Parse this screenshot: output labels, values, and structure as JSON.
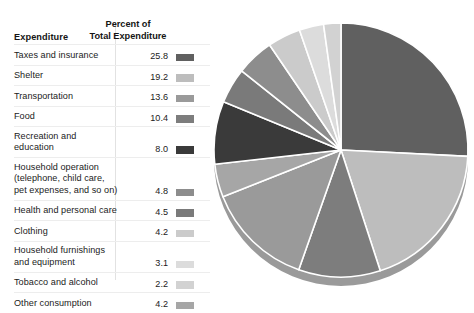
{
  "table": {
    "header_label": "Expenditure",
    "header_percent_line1": "Percent of",
    "header_percent_line2": "Total Expenditure"
  },
  "rows": [
    {
      "label": "Taxes and insurance",
      "label2": "",
      "label3": "",
      "value": "25.8",
      "color": "#606060"
    },
    {
      "label": "Shelter",
      "label2": "",
      "label3": "",
      "value": "19.2",
      "color": "#bdbdbd"
    },
    {
      "label": "Transportation",
      "label2": "",
      "label3": "",
      "value": "13.6",
      "color": "#9a9a9a"
    },
    {
      "label": "Food",
      "label2": "",
      "label3": "",
      "value": "10.4",
      "color": "#7d7d7d"
    },
    {
      "label": "Recreation and education",
      "label2": "",
      "label3": "",
      "value": "8.0",
      "color": "#3a3a3a"
    },
    {
      "label": "Household operation",
      "label2": "(telephone, child care,",
      "label3": "pet expenses, and so on)",
      "value": "4.8",
      "color": "#8d8d8d"
    },
    {
      "label": "Health and personal care",
      "label2": "",
      "label3": "",
      "value": "4.5",
      "color": "#7a7a7a"
    },
    {
      "label": "Clothing",
      "label2": "",
      "label3": "",
      "value": "4.2",
      "color": "#cbcbcb"
    },
    {
      "label": "Household furnishings",
      "label2": "and equipment",
      "label3": "",
      "value": "3.1",
      "color": "#dcdcdc"
    },
    {
      "label": "Tobacco and alcohol",
      "label2": "",
      "label3": "",
      "value": "2.2",
      "color": "#d2d2d2"
    },
    {
      "label": "Other consumption",
      "label2": "",
      "label3": "",
      "value": "4.2",
      "color": "#a6a6a6"
    }
  ],
  "chart_data": {
    "type": "pie",
    "title": "",
    "unit": "percent",
    "start_angle_deg": 0,
    "direction": "clockwise",
    "separator_color": "#ffffff",
    "rim_color": "#9a9a9a",
    "categories": [
      "Taxes and insurance",
      "Shelter",
      "Food",
      "Transportation",
      "Other consumption",
      "Recreation and education",
      "Health and personal care",
      "Household operation",
      "Clothing",
      "Household furnishings and equipment",
      "Tobacco and alcohol"
    ],
    "values": [
      25.8,
      19.2,
      10.4,
      13.6,
      4.2,
      8.0,
      4.5,
      4.8,
      4.2,
      3.1,
      2.2
    ],
    "colors": [
      "#606060",
      "#bdbdbd",
      "#7d7d7d",
      "#9a9a9a",
      "#a6a6a6",
      "#3a3a3a",
      "#7a7a7a",
      "#8d8d8d",
      "#cbcbcb",
      "#dcdcdc",
      "#d2d2d2"
    ],
    "total": 100.0,
    "legend_position": "left",
    "grid": false
  }
}
